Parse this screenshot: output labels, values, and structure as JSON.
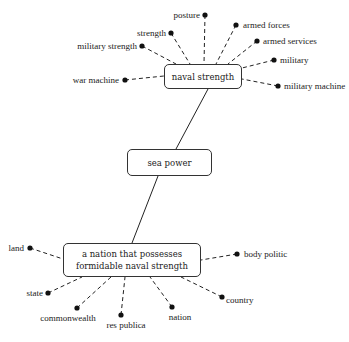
{
  "diagram": {
    "type": "concept-map",
    "nodes": {
      "top": {
        "label": "naval strength"
      },
      "middle": {
        "label": "sea power"
      },
      "bottom": {
        "label_line1": "a nation that possesses",
        "label_line2": "formidable naval strength"
      }
    },
    "top_related_terms": [
      "posture",
      "armed forces",
      "armed services",
      "strength",
      "military strength",
      "military",
      "war machine",
      "military machine"
    ],
    "bottom_related_terms": [
      "land",
      "body politic",
      "state",
      "country",
      "commonwealth",
      "res publica",
      "nation"
    ],
    "edges": [
      {
        "from": "naval strength",
        "to": "sea power",
        "style": "solid"
      },
      {
        "from": "sea power",
        "to": "a nation that possesses formidable naval strength",
        "style": "solid"
      }
    ],
    "colors": {
      "line": "#222222",
      "background": "#ffffff",
      "box_border": "#333333"
    }
  }
}
